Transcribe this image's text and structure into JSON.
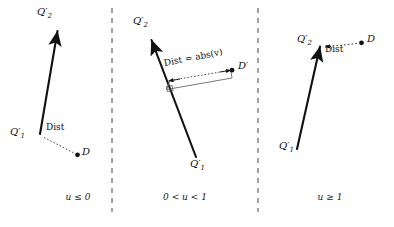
{
  "figure": {
    "width": 394,
    "height": 227,
    "background": "#ffffff",
    "stroke_color": "#111111",
    "dashed_color": "#555555",
    "divider_color": "#444444"
  },
  "panels": [
    {
      "id": "panel-u-le-0",
      "caption": "u ≤ 0",
      "caption_x": 78,
      "caption_y": 196,
      "labels": {
        "q2_prime": "Q′2",
        "q2_base": "Q",
        "q2_sub": "2",
        "q1_prime": "Q′1",
        "q1_base": "Q",
        "q1_sub": "1",
        "d_point": "D",
        "dist": "Dist"
      },
      "geometry": {
        "segment_start_x": 40,
        "segment_start_y": 134,
        "segment_end_x": 57,
        "segment_end_y": 30,
        "d_x": 78,
        "d_y": 155,
        "dist_from_x": 43,
        "dist_from_y": 137,
        "dist_to_x": 75,
        "dist_to_y": 153
      },
      "label_positions": {
        "q2_x": 38,
        "q2_y": 10,
        "q1_x": 12,
        "q1_y": 130,
        "d_x": 82,
        "d_y": 148,
        "dist_x": 48,
        "dist_y": 126
      }
    },
    {
      "id": "panel-u-between",
      "caption": "0 < u < 1",
      "caption_x": 185,
      "caption_y": 196,
      "labels": {
        "q2_prime": "Q′2",
        "q2_base": "Q",
        "q2_sub": "2",
        "q1_prime": "Q′1",
        "q1_base": "Q",
        "q1_sub": "1",
        "d_point": "D",
        "dist": "Dist = abs(v)"
      },
      "geometry": {
        "segment_start_x": 196,
        "segment_start_y": 156,
        "segment_end_x": 152,
        "segment_end_y": 40,
        "d_x": 233,
        "d_y": 70,
        "foot_x": 168,
        "foot_y": 83,
        "bracket_x1": 166,
        "bracket_y1": 90,
        "bracket_x2": 232,
        "bracket_y2": 77
      },
      "label_positions": {
        "q2_x": 134,
        "q2_y": 18,
        "q1_x": 191,
        "q1_y": 162,
        "d_x": 238,
        "d_y": 63,
        "dist_x": 168,
        "dist_y": 66,
        "dist_rotation": -12
      }
    },
    {
      "id": "panel-u-ge-1",
      "caption": "u ≥ 1",
      "caption_x": 330,
      "caption_y": 196,
      "labels": {
        "q2_prime": "Q′2",
        "q2_base": "Q",
        "q2_sub": "2",
        "q1_prime": "Q′1",
        "q1_base": "Q",
        "q1_sub": "1",
        "d_point": "D",
        "dist": "Dist"
      },
      "geometry": {
        "segment_start_x": 297,
        "segment_start_y": 148,
        "segment_end_x": 320,
        "segment_end_y": 46,
        "d_x": 362,
        "d_y": 42,
        "dist_from_x": 359,
        "dist_from_y": 43,
        "dist_to_x": 323,
        "dist_to_y": 47
      },
      "label_positions": {
        "q2_x": 298,
        "q2_y": 36,
        "q1_x": 280,
        "q1_y": 144,
        "d_x": 367,
        "d_y": 36,
        "dist_x": 327,
        "dist_y": 47
      }
    }
  ],
  "dividers": [
    {
      "id": "divider-left",
      "x": 112,
      "y_top": 8,
      "y_bottom": 212
    },
    {
      "id": "divider-right",
      "x": 258,
      "y_top": 8,
      "y_bottom": 212
    }
  ]
}
